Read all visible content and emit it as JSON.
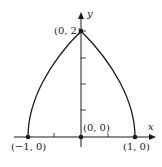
{
  "diagram": {
    "axes": {
      "x_label": "x",
      "y_label": "y"
    },
    "points": [
      {
        "id": "top",
        "label": "(0, 2)"
      },
      {
        "id": "left",
        "label": "(−1, 0)"
      },
      {
        "id": "origin",
        "label": "(0, 0)"
      },
      {
        "id": "right",
        "label": "(1, 0)"
      }
    ],
    "curve": "Region bounded by two concave arcs from (-1,0) and (1,0) meeting at (0,2)"
  }
}
